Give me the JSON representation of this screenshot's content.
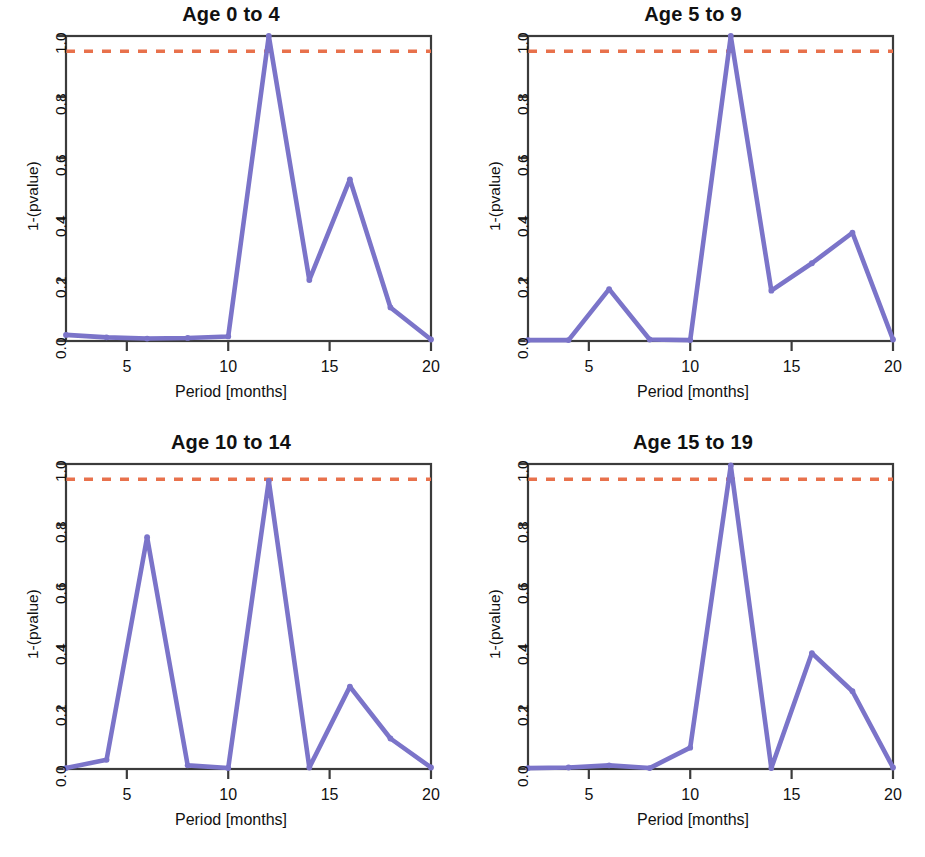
{
  "figure": {
    "background": "#ffffff",
    "line_color": "#7b74c9",
    "threshold_color": "#e8714c",
    "axis_color": "#3b3b3b",
    "text_color": "#111111"
  },
  "chart_data": [
    {
      "type": "line",
      "title": "Age 0 to 4",
      "xlabel": "Period [months]",
      "ylabel": "1-(pvalue)",
      "xlim": [
        2,
        20
      ],
      "ylim": [
        0.0,
        1.0
      ],
      "grid": false,
      "legend": "none",
      "xticks": [
        5,
        10,
        15,
        20
      ],
      "xtick_labels": [
        "5",
        "10",
        "15",
        "20"
      ],
      "yticks": [
        0.0,
        0.2,
        0.4,
        0.6,
        0.8,
        1.0
      ],
      "ytick_labels": [
        "0.0",
        "0.2",
        "0.4",
        "0.6",
        "0.8",
        "1.0"
      ],
      "threshold": 0.95,
      "threshold_label": "0.95",
      "x": [
        2,
        4,
        6,
        8,
        10,
        12,
        14,
        16,
        18,
        20
      ],
      "values": [
        0.02,
        0.012,
        0.008,
        0.01,
        0.015,
        1.0,
        0.2,
        0.53,
        0.11,
        0.005
      ]
    },
    {
      "type": "line",
      "title": "Age 5 to 9",
      "xlabel": "Period [months]",
      "ylabel": "1-(pvalue)",
      "xlim": [
        2,
        20
      ],
      "ylim": [
        0.0,
        1.0
      ],
      "grid": false,
      "legend": "none",
      "xticks": [
        5,
        10,
        15,
        20
      ],
      "xtick_labels": [
        "5",
        "10",
        "15",
        "20"
      ],
      "yticks": [
        0.0,
        0.2,
        0.4,
        0.6,
        0.8,
        1.0
      ],
      "ytick_labels": [
        "0.0",
        "0.2",
        "0.4",
        "0.6",
        "0.8",
        "1.0"
      ],
      "threshold": 0.95,
      "threshold_label": "0.95",
      "x": [
        2,
        4,
        6,
        8,
        10,
        12,
        14,
        16,
        18,
        20
      ],
      "values": [
        0.003,
        0.003,
        0.17,
        0.005,
        0.003,
        1.0,
        0.165,
        0.255,
        0.355,
        0.005
      ]
    },
    {
      "type": "line",
      "title": "Age 10 to 14",
      "xlabel": "Period [months]",
      "ylabel": "1-(pvalue)",
      "xlim": [
        2,
        20
      ],
      "ylim": [
        0.0,
        1.0
      ],
      "grid": false,
      "legend": "none",
      "xticks": [
        5,
        10,
        15,
        20
      ],
      "xtick_labels": [
        "5",
        "10",
        "15",
        "20"
      ],
      "yticks": [
        0.0,
        0.2,
        0.4,
        0.6,
        0.8,
        1.0
      ],
      "ytick_labels": [
        "0.0",
        "0.2",
        "0.4",
        "0.6",
        "0.8",
        "1.0"
      ],
      "threshold": 0.95,
      "threshold_label": "0.95",
      "x": [
        2,
        4,
        6,
        8,
        10,
        12,
        14,
        16,
        18,
        20
      ],
      "values": [
        0.003,
        0.03,
        0.76,
        0.012,
        0.003,
        0.945,
        0.005,
        0.27,
        0.1,
        0.005
      ]
    },
    {
      "type": "line",
      "title": "Age 15 to 19",
      "xlabel": "Period [months]",
      "ylabel": "1-(pvalue)",
      "xlim": [
        2,
        20
      ],
      "ylim": [
        0.0,
        1.0
      ],
      "grid": false,
      "legend": "none",
      "xticks": [
        5,
        10,
        15,
        20
      ],
      "xtick_labels": [
        "5",
        "10",
        "15",
        "20"
      ],
      "yticks": [
        0.0,
        0.2,
        0.4,
        0.6,
        0.8,
        1.0
      ],
      "ytick_labels": [
        "0.0",
        "0.2",
        "0.4",
        "0.6",
        "0.8",
        "1.0"
      ],
      "threshold": 0.95,
      "threshold_label": "0.95",
      "x": [
        2,
        4,
        6,
        8,
        10,
        12,
        14,
        16,
        18,
        20
      ],
      "values": [
        0.003,
        0.005,
        0.012,
        0.003,
        0.07,
        0.995,
        0.003,
        0.38,
        0.255,
        0.005
      ]
    }
  ]
}
